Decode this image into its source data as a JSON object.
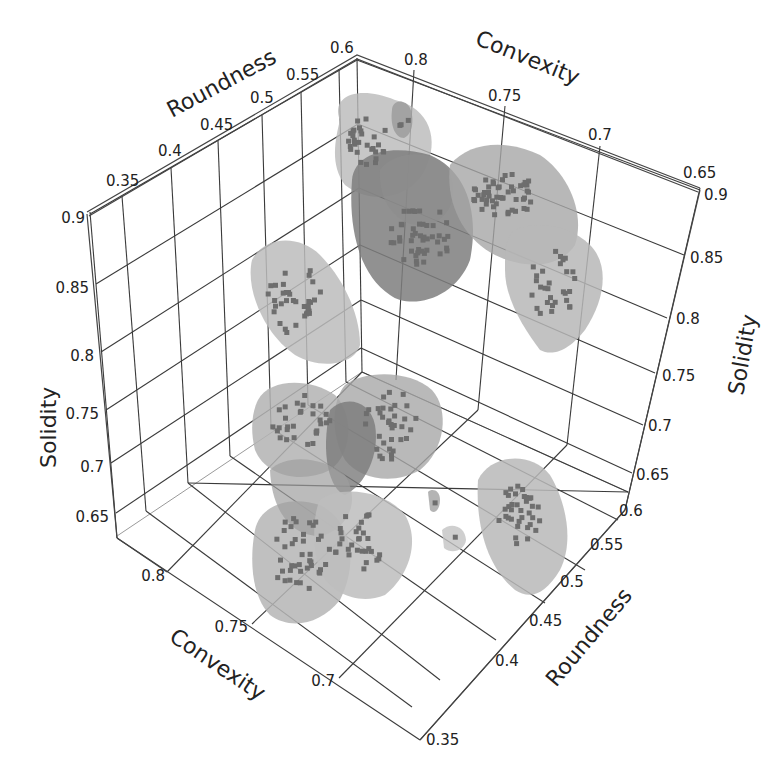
{
  "chart_data": {
    "type": "scatter3d",
    "title": "",
    "axes": {
      "x": {
        "label": "Roundness",
        "ticks": [
          "0.35",
          "0.4",
          "0.45",
          "0.5",
          "0.55",
          "0.6"
        ],
        "range": [
          0.33,
          0.6
        ]
      },
      "y": {
        "label": "Convexity",
        "ticks": [
          "0.8",
          "0.75",
          "0.7",
          "0.65"
        ],
        "range": [
          0.65,
          0.82
        ]
      },
      "z": {
        "label": "Solidity",
        "ticks": [
          "0.9",
          "0.85",
          "0.8",
          "0.75",
          "0.7",
          "0.65"
        ],
        "range": [
          0.63,
          0.9
        ]
      }
    },
    "grid": true,
    "legend": null,
    "render": "point clouds with translucent grey isosurface blobs per cluster",
    "clusters": [
      {
        "id": 1,
        "roundness": 0.58,
        "convexity": 0.79,
        "solidity": 0.86,
        "approx_points": 30
      },
      {
        "id": 2,
        "roundness": 0.56,
        "convexity": 0.76,
        "solidity": 0.84,
        "approx_points": 45
      },
      {
        "id": 3,
        "roundness": 0.58,
        "convexity": 0.73,
        "solidity": 0.87,
        "approx_points": 50
      },
      {
        "id": 4,
        "roundness": 0.6,
        "convexity": 0.7,
        "solidity": 0.83,
        "approx_points": 30
      },
      {
        "id": 5,
        "roundness": 0.42,
        "convexity": 0.8,
        "solidity": 0.84,
        "approx_points": 35
      },
      {
        "id": 6,
        "roundness": 0.45,
        "convexity": 0.79,
        "solidity": 0.71,
        "approx_points": 30
      },
      {
        "id": 7,
        "roundness": 0.5,
        "convexity": 0.76,
        "solidity": 0.72,
        "approx_points": 35
      },
      {
        "id": 8,
        "roundness": 0.45,
        "convexity": 0.77,
        "solidity": 0.66,
        "approx_points": 40
      },
      {
        "id": 9,
        "roundness": 0.5,
        "convexity": 0.74,
        "solidity": 0.66,
        "approx_points": 30
      },
      {
        "id": 10,
        "roundness": 0.55,
        "convexity": 0.68,
        "solidity": 0.67,
        "approx_points": 35
      }
    ]
  },
  "labels": {
    "roundness_top": "Roundness",
    "convexity_top": "Convexity",
    "solidity_left": "Solidity",
    "solidity_right": "Solidity",
    "convexity_bottom": "Convexity",
    "roundness_bottom": "Roundness"
  },
  "ticks": {
    "roundness_top": [
      "0.35",
      "0.4",
      "0.45",
      "0.5",
      "0.55",
      "0.6"
    ],
    "convexity_top": [
      "0.8",
      "0.75",
      "0.7",
      "0.65"
    ],
    "solidity_left": [
      "0.9",
      "0.85",
      "0.8",
      "0.75",
      "0.7",
      "0.65"
    ],
    "solidity_right": [
      "0.9",
      "0.85",
      "0.8",
      "0.75",
      "0.7",
      "0.65"
    ],
    "convexity_bottom": [
      "0.8",
      "0.75",
      "0.7"
    ],
    "roundness_bottom": [
      "0.6",
      "0.55",
      "0.5",
      "0.45",
      "0.4",
      "0.35"
    ]
  },
  "colors": {
    "grid": "#3a3a3a",
    "blob_light": "#c8c8c8",
    "blob_mid": "#a9a9a9",
    "blob_dark": "#7d7d7d",
    "point": "#6e6e6e",
    "text": "#222222"
  }
}
